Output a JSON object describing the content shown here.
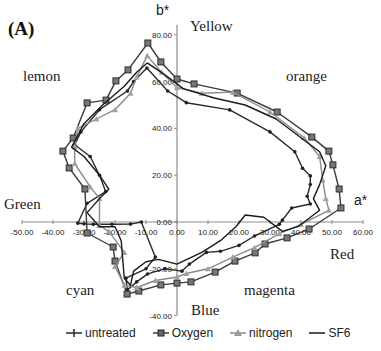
{
  "panel_label": "(A)",
  "axis_names": {
    "x": "a*",
    "y": "b*"
  },
  "color_labels": [
    {
      "text": "Yellow",
      "x": 190,
      "y": 18
    },
    {
      "text": "lemon",
      "x": 23,
      "y": 68
    },
    {
      "text": "orange",
      "x": 286,
      "y": 68
    },
    {
      "text": "Green",
      "x": 4,
      "y": 196
    },
    {
      "text": "Red",
      "x": 330,
      "y": 246
    },
    {
      "text": "cyan",
      "x": 66,
      "y": 282
    },
    {
      "text": "magenta",
      "x": 244,
      "y": 282
    },
    {
      "text": "Blue",
      "x": 191,
      "y": 302
    }
  ],
  "chart_data": {
    "type": "line",
    "title": "(A)",
    "xlabel": "a*",
    "ylabel": "b*",
    "xlim": [
      -50,
      60
    ],
    "ylim": [
      -40,
      80
    ],
    "x_ticks": [
      "-50.00",
      "-40.00",
      "-30.00",
      "-20.00",
      "-10.00",
      "0.00",
      "10.00",
      "20.00",
      "30.00",
      "40.00",
      "50.00",
      "60.00"
    ],
    "y_ticks": [
      "-40.00",
      "-20.00",
      "0.00",
      "20.00",
      "40.00",
      "60.00",
      "80.00"
    ],
    "grid": false,
    "legend_position": "bottom",
    "annotations": [
      "Yellow",
      "lemon",
      "orange",
      "Green",
      "Red",
      "cyan",
      "magenta",
      "Blue"
    ],
    "series": [
      {
        "name": "untreated",
        "marker": "plus",
        "color": "#2a2a2a",
        "points": [
          [
            -9.7,
            65.8
          ],
          [
            -3,
            56
          ],
          [
            3,
            51
          ],
          [
            17,
            47.9
          ],
          [
            30,
            38.5
          ],
          [
            38,
            30
          ],
          [
            40.5,
            23
          ],
          [
            43,
            19.7
          ],
          [
            43,
            16
          ],
          [
            42,
            11
          ],
          [
            43,
            7.7
          ],
          [
            37,
            6
          ],
          [
            34,
            0.8
          ],
          [
            33,
            -1
          ],
          [
            25,
            -6
          ],
          [
            20,
            -10
          ],
          [
            14,
            -12.5
          ],
          [
            9.5,
            -13
          ],
          [
            4,
            -18
          ],
          [
            1.6,
            -21
          ],
          [
            -4,
            -20
          ],
          [
            -9.5,
            -22.2
          ],
          [
            -13,
            -25.6
          ],
          [
            -16,
            -29
          ],
          [
            -16.5,
            -24
          ],
          [
            -10,
            -20
          ],
          [
            -7,
            -15
          ],
          [
            -11.5,
            0
          ],
          [
            -15,
            -0.9
          ],
          [
            -21,
            -1
          ],
          [
            -27,
            -1
          ],
          [
            -30,
            -0.8
          ],
          [
            -32,
            -0.5
          ],
          [
            -29,
            8
          ],
          [
            -23,
            13
          ],
          [
            -25,
            20
          ],
          [
            -28,
            28
          ],
          [
            -33,
            33
          ],
          [
            -31,
            38.5
          ],
          [
            -25,
            48
          ],
          [
            -16,
            56
          ],
          [
            -14,
            60
          ],
          [
            -9.7,
            65.8
          ]
        ]
      },
      {
        "name": "Oxygen",
        "marker": "square",
        "color": "#3a3a3a",
        "points": [
          [
            -9.4,
            76.5
          ],
          [
            -5.2,
            68.4
          ],
          [
            0,
            61.1
          ],
          [
            5.5,
            59.0
          ],
          [
            19.4,
            55.1
          ],
          [
            32.3,
            47.0
          ],
          [
            43.5,
            36.3
          ],
          [
            49.0,
            30.3
          ],
          [
            50.3,
            24.4
          ],
          [
            52.3,
            14.1
          ],
          [
            52.9,
            6.0
          ],
          [
            42.6,
            -3.0
          ],
          [
            35.5,
            -6.8
          ],
          [
            28.4,
            -9.4
          ],
          [
            25.2,
            -13.2
          ],
          [
            18.7,
            -16.7
          ],
          [
            12.3,
            -21.4
          ],
          [
            4.5,
            -25.6
          ],
          [
            0,
            -26.1
          ],
          [
            -5.2,
            -26.9
          ],
          [
            -12.3,
            -29.5
          ],
          [
            -16.1,
            -30.8
          ],
          [
            -20.0,
            -16.7
          ],
          [
            -20.6,
            -10.7
          ],
          [
            -29.0,
            -4.7
          ],
          [
            -29.7,
            14.1
          ],
          [
            -34.8,
            23.1
          ],
          [
            -36.8,
            30.3
          ],
          [
            -33.5,
            35.9
          ],
          [
            -29.0,
            50.9
          ],
          [
            -22.9,
            52.1
          ],
          [
            -19.7,
            60.3
          ],
          [
            -15.8,
            65.0
          ],
          [
            -9.4,
            76.5
          ]
        ]
      },
      {
        "name": "nitrogen",
        "marker": "triangle",
        "color": "#8a8a8a",
        "points": [
          [
            -9.6,
            71
          ],
          [
            -5,
            64
          ],
          [
            0,
            57.5
          ],
          [
            8,
            55
          ],
          [
            18,
            55.5
          ],
          [
            30,
            47
          ],
          [
            41,
            36
          ],
          [
            46,
            28
          ],
          [
            47,
            18
          ],
          [
            48,
            10
          ],
          [
            49,
            5
          ],
          [
            40,
            -1
          ],
          [
            33,
            -5
          ],
          [
            25,
            -11
          ],
          [
            18,
            -15
          ],
          [
            10,
            -20
          ],
          [
            3,
            -22
          ],
          [
            0,
            -23.5
          ],
          [
            -7,
            -25
          ],
          [
            -13,
            -28
          ],
          [
            -17,
            -27
          ],
          [
            -20,
            -19
          ],
          [
            -17,
            -13
          ],
          [
            -22,
            -4
          ],
          [
            -25,
            -1.5
          ],
          [
            -25,
            10
          ],
          [
            -28,
            15
          ],
          [
            -33,
            25
          ],
          [
            -33,
            32
          ],
          [
            -32,
            40
          ],
          [
            -26,
            44
          ],
          [
            -20,
            48
          ],
          [
            -15,
            55
          ],
          [
            -13,
            62
          ],
          [
            -9.6,
            71
          ]
        ]
      },
      {
        "name": "SF6",
        "marker": "none",
        "color": "#1a1a1a",
        "points": [
          [
            -9.6,
            68
          ],
          [
            -4,
            63
          ],
          [
            2,
            57
          ],
          [
            12,
            53
          ],
          [
            22,
            50
          ],
          [
            32,
            44
          ],
          [
            40,
            36
          ],
          [
            46,
            30
          ],
          [
            48,
            24
          ],
          [
            46,
            16
          ],
          [
            44,
            10
          ],
          [
            46,
            5
          ],
          [
            39,
            -2
          ],
          [
            34,
            -4
          ],
          [
            28,
            2
          ],
          [
            22,
            3
          ],
          [
            19,
            -2
          ],
          [
            14,
            -8
          ],
          [
            8,
            -13
          ],
          [
            0,
            -18
          ],
          [
            -6,
            -16
          ],
          [
            -10,
            -17
          ],
          [
            -14,
            -21
          ],
          [
            -15,
            -27
          ],
          [
            -17,
            -24
          ],
          [
            -18,
            -8
          ],
          [
            -20,
            -2
          ],
          [
            -25,
            -2
          ],
          [
            -29,
            4
          ],
          [
            -25,
            10
          ],
          [
            -22,
            14
          ],
          [
            -25,
            20
          ],
          [
            -30,
            28
          ],
          [
            -34,
            32
          ],
          [
            -30,
            42
          ],
          [
            -24,
            50
          ],
          [
            -17,
            58
          ],
          [
            -13,
            64
          ],
          [
            -9.6,
            68
          ]
        ]
      }
    ]
  },
  "legend": [
    {
      "label": "untreated",
      "marker": "plus"
    },
    {
      "label": "Oxygen",
      "marker": "square"
    },
    {
      "label": "nitrogen",
      "marker": "triangle"
    },
    {
      "label": "SF6",
      "marker": "none"
    }
  ]
}
